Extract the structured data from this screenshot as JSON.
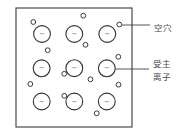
{
  "diagram": {
    "title": "",
    "labels": {
      "hole": "空穴",
      "acceptor_ion_line1": "受主",
      "acceptor_ion_line2": "离子"
    },
    "ion_charge_symbol": "−",
    "frame": {
      "x": 16,
      "y": 8,
      "width": 116,
      "height": 119
    },
    "ion_radius": 8.4,
    "hole_radius": 2.4,
    "acceptor_ions": [
      {
        "cx": 42.0,
        "cy": 34.0
      },
      {
        "cx": 74.3,
        "cy": 34.0
      },
      {
        "cx": 107.3,
        "cy": 34.0
      },
      {
        "cx": 41.6,
        "cy": 68.3
      },
      {
        "cx": 74.3,
        "cy": 68.2
      },
      {
        "cx": 106.8,
        "cy": 68.3
      },
      {
        "cx": 41.7,
        "cy": 101.5
      },
      {
        "cx": 74.3,
        "cy": 101.5
      },
      {
        "cx": 106.8,
        "cy": 101.5
      }
    ],
    "holes": [
      {
        "cx": 33.3,
        "cy": 22.0
      },
      {
        "cx": 83.3,
        "cy": 15.7
      },
      {
        "cx": 85.5,
        "cy": 44.8
      },
      {
        "cx": 119.3,
        "cy": 24.5
      },
      {
        "cx": 47.7,
        "cy": 50.2
      },
      {
        "cx": 118.3,
        "cy": 56.8
      },
      {
        "cx": 64.2,
        "cy": 73.8
      },
      {
        "cx": 90.5,
        "cy": 79.3
      },
      {
        "cx": 30.3,
        "cy": 84.0
      },
      {
        "cx": 118.5,
        "cy": 84.7
      },
      {
        "cx": 64.3,
        "cy": 95.8
      },
      {
        "cx": 96.7,
        "cy": 113.3
      }
    ],
    "leaders": {
      "hole": {
        "x1": 121.8,
        "y1": 25.0,
        "x2": 150.0,
        "y2": 25.0
      },
      "ion": {
        "x1": 115.2,
        "y1": 69.0,
        "x2": 149.0,
        "y2": 69.0
      }
    },
    "label_positions": {
      "hole": {
        "x": 153.5,
        "y": 30.5
      },
      "acceptor_ion_line1": {
        "x": 153.0,
        "y": 66.5
      },
      "acceptor_ion_line2": {
        "x": 153.0,
        "y": 80.0
      }
    },
    "colors": {
      "background": "#ffffff",
      "stroke": "#333333",
      "label": "#4a4a4a"
    }
  }
}
